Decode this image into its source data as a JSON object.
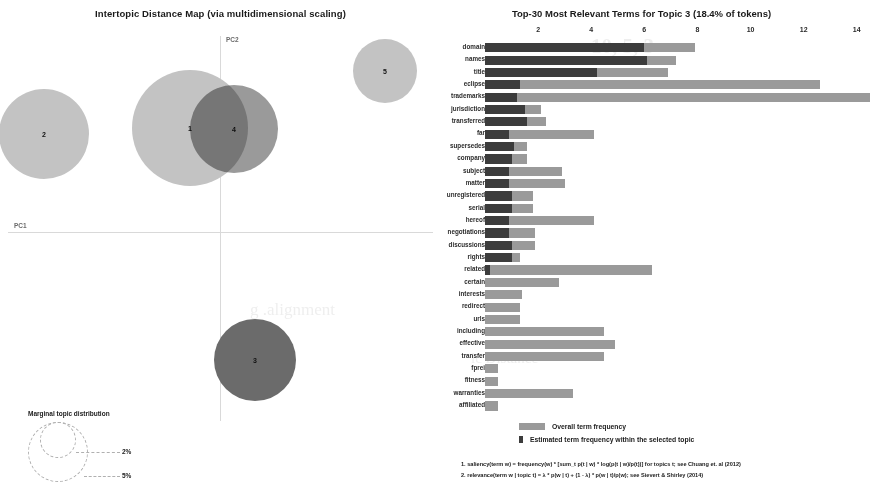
{
  "mds": {
    "title": "Intertopic Distance Map (via multidimensional scaling)",
    "axis_x_label": "PC1",
    "axis_y_label": "PC2",
    "legend_title": "Marginal topic distribution",
    "legend_ticks": [
      "2%",
      "5%"
    ],
    "colors": {
      "unselected": "#c3c3c3",
      "selected": "#6b6b6b",
      "overlap": "#9a9a9a"
    },
    "topics": [
      {
        "id": "2",
        "label": "2",
        "cx": 44,
        "cy": 134,
        "r": 45
      },
      {
        "id": "1",
        "label": "1",
        "cx": 190,
        "cy": 128,
        "r": 58
      },
      {
        "id": "4",
        "label": "4",
        "cx": 234,
        "cy": 129,
        "r": 44
      },
      {
        "id": "5",
        "label": "5",
        "cx": 385,
        "cy": 71,
        "r": 32
      },
      {
        "id": "3",
        "label": "3",
        "cx": 255,
        "cy": 360,
        "r": 41
      }
    ]
  },
  "barchart": {
    "title": "Top-30 Most Relevant Terms for Topic 3 (18.4% of tokens)",
    "topic_number": 3,
    "topic_token_pct": "18.4%",
    "axis_ticks": [
      2,
      4,
      6,
      8,
      10,
      12,
      14
    ],
    "axis_max": 14.8,
    "colors": {
      "overall": "#9a9a9a",
      "topic": "#3c3c3c"
    },
    "legend": [
      {
        "key": "overall",
        "label": "Overall term frequency"
      },
      {
        "key": "topic",
        "label": "Estimated term frequency within the selected topic"
      }
    ],
    "footnotes": [
      "1. saliency(term w) = frequency(w) * [sum_t p(t | w) * log(p(t | w)/p(t))] for topics t; see Chuang et. al (2012)",
      "2. relevance(term w | topic t) = λ * p(w | t) + (1 - λ) * p(w | t)/p(w); see Sievert & Shirley (2014)"
    ]
  },
  "chart_data": {
    "type": "bar",
    "orientation": "horizontal",
    "title": "Top-30 Most Relevant Terms for Topic 3 (18.4% of tokens)",
    "xlabel": "",
    "ylabel": "",
    "xlim": [
      0,
      14.8
    ],
    "grid": false,
    "legend_position": "bottom",
    "categories": [
      "domain",
      "names",
      "title",
      "eclipse",
      "trademarks",
      "jurisdiction",
      "transferred",
      "far",
      "supersedes",
      "company",
      "subject",
      "matter",
      "unregistered",
      "serial",
      "hereof",
      "negotiations",
      "discussions",
      "rights",
      "related",
      "certain",
      "interests",
      "redirect",
      "urls",
      "including",
      "effective",
      "transfer",
      "fprei",
      "fitness",
      "warranties",
      "affiliated"
    ],
    "series": [
      {
        "name": "Overall term frequency",
        "values": [
          7.9,
          7.2,
          6.9,
          12.6,
          14.5,
          2.1,
          2.3,
          4.1,
          1.6,
          1.6,
          2.9,
          3.0,
          1.8,
          1.8,
          4.1,
          1.9,
          1.9,
          1.3,
          6.3,
          2.8,
          1.4,
          1.3,
          1.3,
          4.5,
          4.9,
          4.5,
          0.5,
          0.5,
          3.3,
          0.5
        ]
      },
      {
        "name": "Estimated term frequency within the selected topic",
        "values": [
          6.0,
          6.1,
          4.2,
          1.3,
          1.2,
          1.5,
          1.6,
          0.9,
          1.1,
          1.0,
          0.9,
          0.9,
          1.0,
          1.0,
          0.9,
          0.9,
          1.0,
          1.0,
          0.2,
          0.0,
          0.0,
          0.0,
          0.0,
          0.0,
          0.0,
          0.0,
          0.0,
          0.0,
          0.0,
          0.0
        ]
      }
    ]
  },
  "ghost_text": {
    "line1": "10, 5, 3",
    "line2": "g .alignment",
    "line3": "ic Distance"
  }
}
